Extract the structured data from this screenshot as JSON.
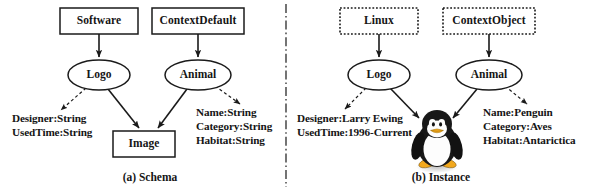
{
  "figure": {
    "panels": [
      {
        "id": "schema",
        "caption": "(a) Schema",
        "caption_x": 150,
        "caption_y": 178,
        "boxes": [
          {
            "name": "software-box",
            "label": "Software",
            "x": 60,
            "y": 8,
            "w": 78,
            "h": 26,
            "border": "solid"
          },
          {
            "name": "contextdefault-box",
            "label": "ContextDefault",
            "x": 152,
            "y": 8,
            "w": 92,
            "h": 26,
            "border": "solid"
          },
          {
            "name": "image-box",
            "label": "Image",
            "x": 113,
            "y": 131,
            "w": 62,
            "h": 26,
            "border": "solid"
          }
        ],
        "ellipses": [
          {
            "name": "logo-ellipse",
            "label": "Logo",
            "cx": 99,
            "cy": 75,
            "rx": 31,
            "ry": 15
          },
          {
            "name": "animal-ellipse",
            "label": "Animal",
            "cx": 198,
            "cy": 75,
            "rx": 33,
            "ry": 15
          }
        ],
        "attribute_groups": [
          {
            "name": "logo-attributes",
            "x": 12,
            "y": 117,
            "lines": [
              "Designer:String",
              "UsedTime:String"
            ]
          },
          {
            "name": "animal-attributes",
            "x": 196,
            "y": 110,
            "lines": [
              "Name:String",
              "Category:String",
              "Habitat:String"
            ]
          }
        ],
        "edges": [
          {
            "name": "software-to-logo",
            "style": "solid",
            "x1": 99,
            "y1": 34,
            "x2": 99,
            "y2": 58
          },
          {
            "name": "contextdefault-to-animal",
            "style": "solid",
            "x1": 198,
            "y1": 34,
            "x2": 198,
            "y2": 58
          },
          {
            "name": "logo-to-image",
            "style": "solid",
            "x1": 108,
            "y1": 89,
            "x2": 140,
            "y2": 129
          },
          {
            "name": "animal-to-image",
            "style": "solid",
            "x1": 186,
            "y1": 89,
            "x2": 157,
            "y2": 129
          },
          {
            "name": "logo-to-attributes",
            "style": "dashed",
            "x1": 86,
            "y1": 88,
            "x2": 60,
            "y2": 111
          },
          {
            "name": "animal-to-attributes",
            "style": "dashed",
            "x1": 215,
            "y1": 86,
            "x2": 241,
            "y2": 105
          }
        ]
      },
      {
        "id": "instance",
        "caption": "(b) Instance",
        "caption_x": 441,
        "caption_y": 178,
        "boxes": [
          {
            "name": "linux-box",
            "label": "Linux",
            "x": 340,
            "y": 8,
            "w": 78,
            "h": 26,
            "border": "dotted"
          },
          {
            "name": "contextobject-box",
            "label": "ContextObject",
            "x": 443,
            "y": 8,
            "w": 92,
            "h": 26,
            "border": "dotted"
          }
        ],
        "ellipses": [
          {
            "name": "logo-ellipse",
            "label": "Logo",
            "cx": 379,
            "cy": 75,
            "rx": 31,
            "ry": 15
          },
          {
            "name": "animal-ellipse",
            "label": "Animal",
            "cx": 489,
            "cy": 75,
            "rx": 33,
            "ry": 15
          }
        ],
        "attribute_groups": [
          {
            "name": "logo-attributes",
            "x": 297,
            "y": 117,
            "lines": [
              "Designer:Larry Ewing",
              "UsedTime:1996-Current"
            ]
          },
          {
            "name": "animal-attributes",
            "x": 483,
            "y": 110,
            "lines": [
              "Name:Penguin",
              "Category:Aves",
              "Habitat:Antarictica"
            ]
          }
        ],
        "edges": [
          {
            "name": "linux-to-logo",
            "style": "solid",
            "x1": 379,
            "y1": 34,
            "x2": 379,
            "y2": 58
          },
          {
            "name": "contextobject-to-animal",
            "style": "solid",
            "x1": 489,
            "y1": 34,
            "x2": 489,
            "y2": 58
          },
          {
            "name": "logo-to-tux",
            "style": "solid",
            "x1": 390,
            "y1": 88,
            "x2": 420,
            "y2": 119
          },
          {
            "name": "animal-to-tux",
            "style": "solid",
            "x1": 476,
            "y1": 89,
            "x2": 452,
            "y2": 119
          },
          {
            "name": "logo-to-attributes",
            "style": "dashed",
            "x1": 366,
            "y1": 88,
            "x2": 344,
            "y2": 110
          },
          {
            "name": "animal-to-attributes",
            "style": "dashed",
            "x1": 505,
            "y1": 86,
            "x2": 528,
            "y2": 105
          }
        ],
        "image_node": {
          "name": "tux-penguin-image",
          "alt": "Tux the Linux penguin mascot",
          "cx": 437,
          "cy": 145,
          "w": 42,
          "h": 54
        }
      }
    ],
    "divider": {
      "name": "panel-divider",
      "style": "dash-dot-vertical",
      "x": 286,
      "y1": 4,
      "y2": 187
    },
    "colors": {
      "stroke": "#1a1a1a",
      "text": "#151515",
      "background": "#ffffff",
      "tux_body": "#181818",
      "tux_belly": "#fdfdfd",
      "tux_beak": "#f2a81d",
      "tux_shadow": "#cfcfcf"
    }
  }
}
